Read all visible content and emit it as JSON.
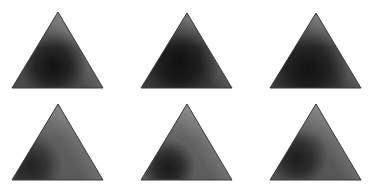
{
  "figure": {
    "rows": 2,
    "cols": 3,
    "edge_color": "#3a3a3a",
    "background": "#ffffff"
  },
  "panels": [
    {
      "id": "panel-1",
      "row": 1,
      "col": 1,
      "apex": [
        58,
        12
      ],
      "left": [
        12,
        88
      ],
      "right": [
        103,
        88
      ],
      "dark_center": [
        0.45,
        0.68
      ],
      "dark_color": "#0b0b0b",
      "mid_color": "#4a4a4a",
      "light_color": "#8e8e8e",
      "dark_radius": 0.38
    },
    {
      "id": "panel-2",
      "row": 1,
      "col": 2,
      "apex": [
        187,
        13
      ],
      "left": [
        141,
        88
      ],
      "right": [
        232,
        88
      ],
      "dark_center": [
        0.42,
        0.62
      ],
      "dark_color": "#080808",
      "mid_color": "#3c3c3c",
      "light_color": "#858585",
      "dark_radius": 0.45
    },
    {
      "id": "panel-3",
      "row": 1,
      "col": 3,
      "apex": [
        316,
        13
      ],
      "left": [
        270,
        88
      ],
      "right": [
        361,
        88
      ],
      "dark_center": [
        0.42,
        0.7
      ],
      "dark_color": "#0d0d0d",
      "mid_color": "#3e3e3e",
      "light_color": "#8a8a8a",
      "dark_radius": 0.45
    },
    {
      "id": "panel-4",
      "row": 2,
      "col": 1,
      "apex": [
        58,
        104
      ],
      "left": [
        12,
        180
      ],
      "right": [
        103,
        180
      ],
      "dark_center": [
        0.2,
        0.8
      ],
      "dark_color": "#1e1e1e",
      "mid_color": "#5a5a5a",
      "light_color": "#8f8f8f",
      "dark_radius": 0.35
    },
    {
      "id": "panel-5",
      "row": 2,
      "col": 2,
      "apex": [
        187,
        104
      ],
      "left": [
        141,
        180
      ],
      "right": [
        232,
        180
      ],
      "dark_center": [
        0.3,
        0.82
      ],
      "dark_color": "#141414",
      "mid_color": "#5c5c5c",
      "light_color": "#969696",
      "dark_radius": 0.3
    },
    {
      "id": "panel-6",
      "row": 2,
      "col": 3,
      "apex": [
        316,
        104
      ],
      "left": [
        270,
        180
      ],
      "right": [
        361,
        180
      ],
      "dark_center": [
        0.3,
        0.7
      ],
      "dark_color": "#161616",
      "mid_color": "#555555",
      "light_color": "#939393",
      "dark_radius": 0.33
    }
  ]
}
